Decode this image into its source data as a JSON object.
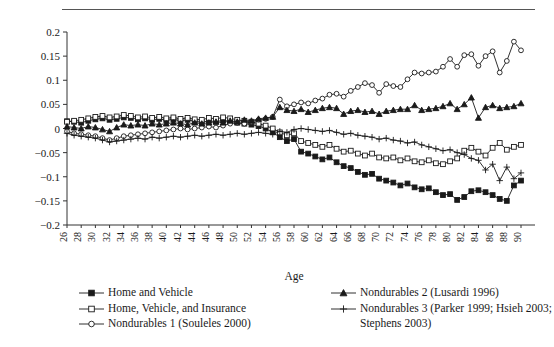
{
  "chart_data": {
    "type": "line",
    "title": "",
    "xlabel": "Age",
    "ylabel": "",
    "xlim": [
      26,
      90
    ],
    "ylim": [
      -0.2,
      0.2
    ],
    "yticks": [
      0.2,
      0.15,
      0.1,
      0.05,
      0,
      -0.05,
      -0.1,
      -0.15,
      -0.2
    ],
    "ytick_labels": [
      "0.2",
      "0.15",
      "0.1",
      "0.05",
      "0",
      "−0.05",
      "−0.1",
      "−0.15",
      "−0.2"
    ],
    "xticks": [
      26,
      28,
      30,
      32,
      34,
      36,
      38,
      40,
      42,
      44,
      46,
      48,
      50,
      52,
      54,
      56,
      58,
      60,
      62,
      64,
      66,
      68,
      70,
      72,
      74,
      76,
      78,
      80,
      82,
      84,
      86,
      88,
      90
    ],
    "xtick_labels": [
      "26",
      "28",
      "30",
      "32",
      "34",
      "36",
      "38",
      "40",
      "42",
      "44",
      "46",
      "48",
      "50",
      "52",
      "54",
      "56",
      "58",
      "60",
      "62",
      "64",
      "66",
      "68",
      "70",
      "72",
      "74",
      "76",
      "78",
      "80",
      "82",
      "84",
      "86",
      "88",
      "90"
    ],
    "grid": false,
    "legend_position": "bottom",
    "x": [
      26,
      27,
      28,
      29,
      30,
      31,
      32,
      33,
      34,
      35,
      36,
      37,
      38,
      39,
      40,
      41,
      42,
      43,
      44,
      45,
      46,
      47,
      48,
      49,
      50,
      51,
      52,
      53,
      54,
      55,
      56,
      57,
      58,
      59,
      60,
      61,
      62,
      63,
      64,
      65,
      66,
      67,
      68,
      69,
      70,
      71,
      72,
      73,
      74,
      75,
      76,
      77,
      78,
      79,
      80,
      81,
      82,
      83,
      84,
      85,
      86,
      87,
      88,
      89,
      90
    ],
    "series": [
      {
        "name": "Home and Vehicle",
        "marker": "filled-square",
        "values": [
          0.015,
          0.014,
          0.012,
          0.016,
          0.019,
          0.021,
          0.018,
          0.02,
          0.023,
          0.022,
          0.019,
          0.021,
          0.018,
          0.02,
          0.017,
          0.019,
          0.016,
          0.018,
          0.015,
          0.013,
          0.016,
          0.014,
          0.017,
          0.015,
          0.012,
          0.01,
          0.008,
          0.005,
          0.0,
          -0.008,
          -0.018,
          -0.026,
          -0.022,
          -0.048,
          -0.052,
          -0.058,
          -0.064,
          -0.06,
          -0.07,
          -0.078,
          -0.082,
          -0.09,
          -0.096,
          -0.094,
          -0.104,
          -0.108,
          -0.112,
          -0.118,
          -0.114,
          -0.122,
          -0.126,
          -0.124,
          -0.132,
          -0.138,
          -0.136,
          -0.148,
          -0.142,
          -0.13,
          -0.128,
          -0.132,
          -0.138,
          -0.146,
          -0.15,
          -0.118,
          -0.108
        ]
      },
      {
        "name": "Home, Vehicle, and Insurance",
        "marker": "open-square",
        "values": [
          0.014,
          0.016,
          0.018,
          0.021,
          0.024,
          0.026,
          0.023,
          0.025,
          0.028,
          0.026,
          0.023,
          0.025,
          0.022,
          0.024,
          0.021,
          0.023,
          0.02,
          0.022,
          0.019,
          0.018,
          0.022,
          0.02,
          0.023,
          0.021,
          0.018,
          0.016,
          0.014,
          0.01,
          0.006,
          0.0,
          -0.008,
          -0.014,
          -0.01,
          -0.026,
          -0.03,
          -0.034,
          -0.038,
          -0.034,
          -0.042,
          -0.048,
          -0.046,
          -0.052,
          -0.056,
          -0.052,
          -0.06,
          -0.062,
          -0.06,
          -0.066,
          -0.062,
          -0.068,
          -0.07,
          -0.066,
          -0.072,
          -0.074,
          -0.068,
          -0.062,
          -0.046,
          -0.04,
          -0.048,
          -0.056,
          -0.04,
          -0.03,
          -0.044,
          -0.038,
          -0.034
        ]
      },
      {
        "name": "Nondurables 1 (Souleles 2000)",
        "marker": "open-circle",
        "values": [
          -0.006,
          -0.01,
          -0.012,
          -0.014,
          -0.016,
          -0.02,
          -0.024,
          -0.02,
          -0.016,
          -0.014,
          -0.012,
          -0.01,
          -0.008,
          -0.006,
          -0.004,
          -0.002,
          0.0,
          -0.002,
          0.0,
          0.002,
          0.004,
          0.002,
          0.006,
          0.01,
          0.012,
          0.01,
          0.014,
          0.018,
          0.02,
          0.024,
          0.06,
          0.046,
          0.05,
          0.054,
          0.052,
          0.058,
          0.062,
          0.07,
          0.072,
          0.066,
          0.078,
          0.086,
          0.094,
          0.09,
          0.074,
          0.092,
          0.088,
          0.086,
          0.102,
          0.116,
          0.114,
          0.116,
          0.118,
          0.128,
          0.144,
          0.128,
          0.152,
          0.154,
          0.13,
          0.15,
          0.16,
          0.116,
          0.14,
          0.18,
          0.162
        ]
      },
      {
        "name": "Nondurables 2 (Lusardi 1996)",
        "marker": "filled-triangle",
        "values": [
          0.004,
          0.002,
          0.0,
          0.004,
          0.002,
          -0.002,
          -0.006,
          0.002,
          0.008,
          0.006,
          0.008,
          0.006,
          0.01,
          0.008,
          0.01,
          0.012,
          0.01,
          0.008,
          0.012,
          0.01,
          0.012,
          0.014,
          0.012,
          0.016,
          0.014,
          0.018,
          0.016,
          0.02,
          0.022,
          0.024,
          0.044,
          0.038,
          0.036,
          0.04,
          0.034,
          0.038,
          0.042,
          0.044,
          0.042,
          0.03,
          0.036,
          0.038,
          0.034,
          0.036,
          0.03,
          0.036,
          0.038,
          0.04,
          0.04,
          0.048,
          0.038,
          0.04,
          0.042,
          0.046,
          0.052,
          0.04,
          0.05,
          0.064,
          0.022,
          0.044,
          0.048,
          0.042,
          0.044,
          0.046,
          0.052
        ]
      },
      {
        "name": "Nondurables 3 (Parker 1999; Hsieh 2003; Stephens 2003)",
        "marker": "plus",
        "values": [
          -0.01,
          -0.014,
          -0.016,
          -0.018,
          -0.02,
          -0.024,
          -0.028,
          -0.026,
          -0.024,
          -0.022,
          -0.02,
          -0.022,
          -0.018,
          -0.02,
          -0.018,
          -0.016,
          -0.018,
          -0.016,
          -0.014,
          -0.016,
          -0.014,
          -0.012,
          -0.014,
          -0.012,
          -0.01,
          -0.012,
          -0.01,
          -0.008,
          -0.01,
          -0.012,
          -0.006,
          -0.008,
          -0.002,
          0.0,
          -0.002,
          -0.004,
          -0.006,
          -0.004,
          -0.008,
          -0.012,
          -0.01,
          -0.014,
          -0.016,
          -0.018,
          -0.022,
          -0.02,
          -0.024,
          -0.026,
          -0.03,
          -0.028,
          -0.034,
          -0.038,
          -0.042,
          -0.046,
          -0.044,
          -0.05,
          -0.054,
          -0.062,
          -0.066,
          -0.086,
          -0.074,
          -0.108,
          -0.08,
          -0.104,
          -0.092
        ]
      }
    ]
  },
  "legend": {
    "left_entries": [
      {
        "label": "Home and Vehicle",
        "marker": "filled-square"
      },
      {
        "label": "Home, Vehicle, and Insurance",
        "marker": "open-square"
      },
      {
        "label": "Nondurables 1 (Souleles 2000)",
        "marker": "open-circle"
      }
    ],
    "right_entries": [
      {
        "label": "Nondurables 2 (Lusardi 1996)",
        "marker": "filled-triangle"
      },
      {
        "label": "Nondurables 3 (Parker 1999; Hsieh 2003;",
        "marker": "plus"
      },
      {
        "label": "Stephens 2003)",
        "marker": "none"
      }
    ]
  },
  "colors": {
    "ink": "#1a1a1a",
    "axis": "#333333",
    "rule": "#555555",
    "background": "#ffffff"
  }
}
